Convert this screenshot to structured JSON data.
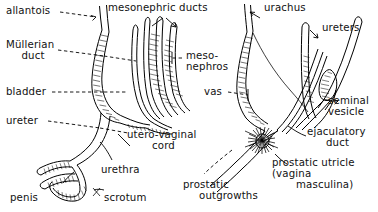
{
  "figure": {
    "name": "embryological-development-of-urogenital-ducts",
    "panels": [
      {
        "id": "left",
        "name": "female-urogenital-panel"
      },
      {
        "id": "right",
        "name": "male-urogenital-panel"
      }
    ]
  },
  "labels": {
    "allantois": "allantois",
    "mesonephric_ducts": "mesonephric ducts",
    "urachus": "urachus",
    "mullerian_duct_line1": "Müllerian",
    "mullerian_duct_line2": "duct",
    "ureters": "ureters",
    "mesonephros_line1": "meso-",
    "mesonephros_line2": "nephros",
    "bladder": "bladder",
    "vas": "vas",
    "seminal_vesicle_line1": "seminal",
    "seminal_vesicle_line2": "vesicle",
    "ureter": "ureter",
    "utero_vaginal_cord_line1": "utero-vaginal",
    "utero_vaginal_cord_line2": "cord",
    "ejaculatory_duct_line1": "ejaculatory",
    "ejaculatory_duct_line2": "duct",
    "prostatic_utricle_line1": "prostatic utricle",
    "prostatic_utricle_line2": "(vagina",
    "prostatic_utricle_line3": "masculina)",
    "urethra": "urethra",
    "prostatic_outgrowths_line1": "prostatic",
    "prostatic_outgrowths_line2": "outgrowths",
    "penis": "penis",
    "scrotum": "scrotum"
  },
  "colors": {
    "ink": "#000000",
    "background": "#ffffff"
  }
}
